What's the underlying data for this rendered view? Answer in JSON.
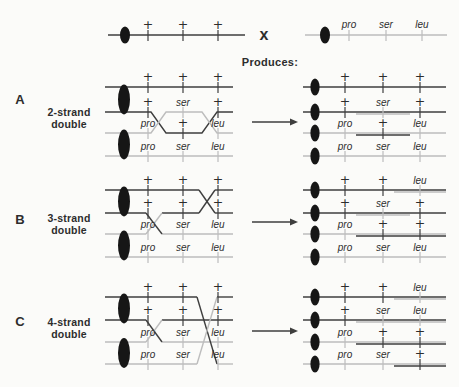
{
  "colors": {
    "dark": "#3e3e3e",
    "light": "#bdbdbd",
    "text": "#2d2d2d",
    "centromere": "#161616",
    "bg": "#fbfbf9"
  },
  "header": {
    "left_markers": [
      "+",
      "+",
      "+"
    ],
    "right_markers": [
      "pro",
      "ser",
      "leu"
    ],
    "cross_symbol": "x",
    "produces_label": "Produces:"
  },
  "sections": [
    {
      "letter": "A",
      "title_line1": "2-strand",
      "title_line2": "double",
      "left_rows": [
        [
          "+",
          "+",
          "+"
        ],
        [
          "+",
          "ser",
          "+"
        ],
        [
          "pro",
          "+",
          "leu"
        ],
        [
          "pro",
          "ser",
          "leu"
        ]
      ],
      "left_tick_shades": [
        [
          "d",
          "d",
          "d"
        ],
        [
          "d",
          "l",
          "d"
        ],
        [
          "l",
          "d",
          "l"
        ],
        [
          "l",
          "l",
          "l"
        ]
      ],
      "products": [
        {
          "markers": [
            "+",
            "+",
            "+"
          ],
          "shades": [
            "d",
            "d",
            "d"
          ]
        },
        {
          "markers": [
            "+",
            "ser",
            "+"
          ],
          "shades": [
            "d",
            "l",
            "d"
          ]
        },
        {
          "markers": [
            "pro",
            "+",
            "leu"
          ],
          "shades": [
            "l",
            "d",
            "l"
          ]
        },
        {
          "markers": [
            "pro",
            "ser",
            "leu"
          ],
          "shades": [
            "l",
            "l",
            "l"
          ]
        }
      ]
    },
    {
      "letter": "B",
      "title_line1": "3-strand",
      "title_line2": "double",
      "left_rows": [
        [
          "+",
          "+",
          "+"
        ],
        [
          "+",
          "+",
          "+"
        ],
        [
          "pro",
          "ser",
          "leu"
        ],
        [
          "pro",
          "ser",
          "leu"
        ]
      ],
      "left_tick_shades": [
        [
          "d",
          "d",
          "d"
        ],
        [
          "d",
          "d",
          "d"
        ],
        [
          "l",
          "l",
          "l"
        ],
        [
          "l",
          "l",
          "l"
        ]
      ],
      "products": [
        {
          "markers": [
            "+",
            "+",
            "leu"
          ],
          "shades": [
            "d",
            "d",
            "l"
          ]
        },
        {
          "markers": [
            "+",
            "ser",
            "+"
          ],
          "shades": [
            "d",
            "l",
            "d"
          ]
        },
        {
          "markers": [
            "pro",
            "+",
            "+"
          ],
          "shades": [
            "l",
            "d",
            "d"
          ]
        },
        {
          "markers": [
            "pro",
            "ser",
            "leu"
          ],
          "shades": [
            "l",
            "l",
            "l"
          ]
        }
      ]
    },
    {
      "letter": "C",
      "title_line1": "4-strand",
      "title_line2": "double",
      "left_rows": [
        [
          "+",
          "+",
          "+"
        ],
        [
          "+",
          "+",
          "+"
        ],
        [
          "pro",
          "ser",
          "leu"
        ],
        [
          "pro",
          "ser",
          "leu"
        ]
      ],
      "left_tick_shades": [
        [
          "d",
          "d",
          "d"
        ],
        [
          "d",
          "d",
          "d"
        ],
        [
          "l",
          "l",
          "l"
        ],
        [
          "l",
          "l",
          "l"
        ]
      ],
      "products": [
        {
          "markers": [
            "+",
            "+",
            "leu"
          ],
          "shades": [
            "d",
            "d",
            "l"
          ]
        },
        {
          "markers": [
            "+",
            "ser",
            "leu"
          ],
          "shades": [
            "d",
            "l",
            "l"
          ]
        },
        {
          "markers": [
            "pro",
            "+",
            "+"
          ],
          "shades": [
            "l",
            "d",
            "d"
          ]
        },
        {
          "markers": [
            "pro",
            "ser",
            "+"
          ],
          "shades": [
            "l",
            "l",
            "d"
          ]
        }
      ]
    }
  ]
}
